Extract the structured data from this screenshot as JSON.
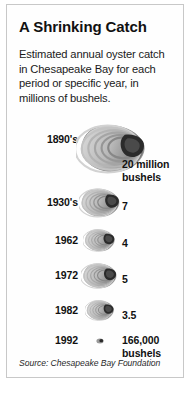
{
  "title": "A Shrinking Catch",
  "subtitle": "Estimated annual oyster catch in Chesapeake Bay for each period or specific year, in millions of bushels.",
  "source": "Source: Chesapeake Bay Foundation",
  "colors": {
    "background": "#ffffff",
    "frame_border": "#c8c8c8",
    "text": "#111111",
    "shell_light": "#dcdcdc",
    "shell_mid": "#9a9a9a",
    "shell_dark": "#2b2b2b"
  },
  "chart_data": {
    "type": "bar",
    "title": "A Shrinking Catch",
    "subtitle": "Estimated annual oyster catch in Chesapeake Bay for each period or specific year, in millions of bushels.",
    "xlabel": "",
    "ylabel": "Millions of bushels",
    "categories": [
      "1890's",
      "1930's",
      "1962",
      "1972",
      "1982",
      "1992"
    ],
    "values": [
      20,
      7,
      4,
      5,
      3.5,
      0.166
    ],
    "value_labels": [
      "20 million\nbushels",
      "7",
      "4",
      "5",
      "3.5",
      "166,000\nbushels"
    ],
    "units": "millions of bushels",
    "note": "Pictorial chart: each value represented by a proportionally sized oyster shell icon",
    "source": "Source: Chesapeake Bay Foundation"
  },
  "rows": [
    {
      "year": "1890's",
      "value": "20 million\nbushels",
      "icon": "oyster-shell-icon",
      "shell_width": 72,
      "shell_height": 54,
      "shell_x": 76,
      "shell_y": 122,
      "year_y": 133,
      "value_y": 158
    },
    {
      "year": "1930's",
      "value": "7",
      "icon": "oyster-shell-icon",
      "shell_width": 42,
      "shell_height": 32,
      "shell_x": 79,
      "shell_y": 187,
      "year_y": 196,
      "value_y": 200
    },
    {
      "year": "1962",
      "value": "4",
      "icon": "oyster-shell-icon",
      "shell_width": 33,
      "shell_height": 25,
      "shell_x": 83,
      "shell_y": 228,
      "year_y": 234,
      "value_y": 237
    },
    {
      "year": "1972",
      "value": "5",
      "icon": "oyster-shell-icon",
      "shell_width": 37,
      "shell_height": 28,
      "shell_x": 81,
      "shell_y": 262,
      "year_y": 269,
      "value_y": 273
    },
    {
      "year": "1982",
      "value": "3.5",
      "icon": "oyster-shell-icon",
      "shell_width": 30,
      "shell_height": 23,
      "shell_x": 85,
      "shell_y": 299,
      "year_y": 304,
      "value_y": 309
    },
    {
      "year": "1992",
      "value": "166,000\nbushels",
      "icon": "oyster-shell-icon",
      "shell_width": 8,
      "shell_height": 6,
      "shell_x": 96,
      "shell_y": 338,
      "year_y": 334,
      "value_y": 334
    }
  ]
}
